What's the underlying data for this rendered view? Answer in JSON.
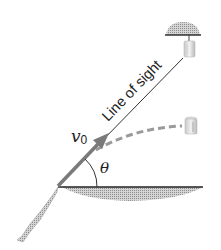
{
  "diagram": {
    "type": "projectile-monkey-hunter",
    "labels": {
      "line_of_sight": "Line of sight",
      "velocity_symbol": "v",
      "velocity_subscript": "0",
      "angle_symbol": "θ"
    },
    "elements": [
      "launcher-tube",
      "initial-velocity-arrow",
      "line-of-sight",
      "angle-arc",
      "ground-line",
      "electromagnet",
      "suspended-can",
      "falling-can",
      "projectile-trajectory"
    ],
    "colors": {
      "line": "#222222",
      "arrow": "#7a7a7a",
      "dashed_path": "#9a9a9a",
      "shading": "#b5b5b5"
    }
  }
}
